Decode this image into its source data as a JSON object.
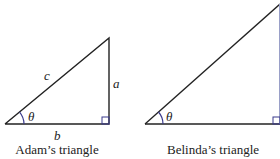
{
  "colors": {
    "line": "#222222",
    "right_angle_marker": "#3a3a8c",
    "background": "#ffffff"
  },
  "adam": {
    "caption": "Adam’s triangle",
    "hypotenuse_label": "c",
    "opposite_label": "a",
    "adjacent_label": "b",
    "angle_label": "θ"
  },
  "belinda": {
    "caption": "Belinda’s triangle",
    "angle_label": "θ"
  }
}
